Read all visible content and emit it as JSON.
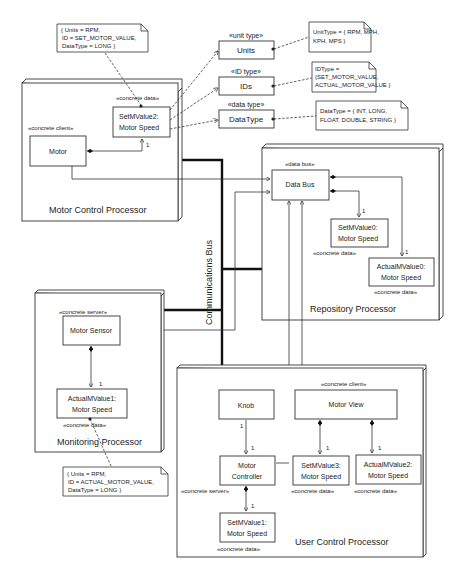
{
  "nodes": {
    "motor_control": {
      "label": "Motor Control Processor"
    },
    "repository": {
      "label": "Repository Processor"
    },
    "monitoring": {
      "label": "Monitoring Processor"
    },
    "user_control": {
      "label": "User Control Processor"
    }
  },
  "bus": {
    "label": "Communications Bus"
  },
  "classes": {
    "motor": {
      "stereotype": "«concrete client»",
      "name": "Motor"
    },
    "setmvalue2": {
      "stereotype": "«concrete data»",
      "line1": "SetMValue2:",
      "line2": "Motor Speed"
    },
    "units": {
      "stereotype": "«unit type»",
      "name": "Units"
    },
    "ids": {
      "stereotype": "«ID type»",
      "name": "IDs"
    },
    "datatype": {
      "stereotype": "«data type»",
      "name": "DataType"
    },
    "databus": {
      "stereotype": "«data bus»",
      "name": "Data Bus"
    },
    "setmvalue0": {
      "stereotype": "«concrete data»",
      "line1": "SetMValue0:",
      "line2": "Motor Speed"
    },
    "actualmvalue0": {
      "stereotype": "«concrete data»",
      "line1": "ActualMValue0:",
      "line2": "Motor Speed"
    },
    "motorsensor": {
      "stereotype": "«concrete server»",
      "name": "Motor Sensor"
    },
    "actualmvalue1": {
      "stereotype": "«concrete data»",
      "line1": "ActualMValue1:",
      "line2": "Motor Speed"
    },
    "knob": {
      "name": "Knob"
    },
    "motorcontroller": {
      "stereotype": "«concrete server»",
      "line1": "Motor",
      "line2": "Controller"
    },
    "setmvalue1": {
      "stereotype": "«concrete data»",
      "line1": "SetMValue1:",
      "line2": "Motor Speed"
    },
    "motorview": {
      "stereotype": "«concrete client»",
      "name": "Motor View"
    },
    "setmvalue3": {
      "stereotype": "«concrete data»",
      "line1": "SetMValue3:",
      "line2": "Motor Speed"
    },
    "actualmvalue2": {
      "stereotype": "«concrete data»",
      "line1": "ActualMValue2:",
      "line2": "Motor Speed"
    }
  },
  "notes": {
    "note_set": {
      "lines": [
        "{ Units = RPM,",
        "ID = SET_MOTOR_VALUE,",
        "DataType = LONG }"
      ]
    },
    "note_unit": {
      "lines": [
        "UnitType = { RPM, MPH,",
        "KPH, MPS }"
      ]
    },
    "note_id": {
      "lines": [
        "IDType =",
        "{SET_MOTOR_VALUE,",
        "ACTUAL_MOTOR_VALUE }"
      ]
    },
    "note_data": {
      "lines": [
        "DataType = { INT, LONG,",
        "FLOAT, DOUBLE, STRING }"
      ]
    },
    "note_actual": {
      "lines": [
        "{ Units = RPM,",
        "ID = ACTUAL_MOTOR_VALUE,",
        "DataType = LONG }"
      ]
    }
  },
  "multiplicity": {
    "one": "1"
  }
}
